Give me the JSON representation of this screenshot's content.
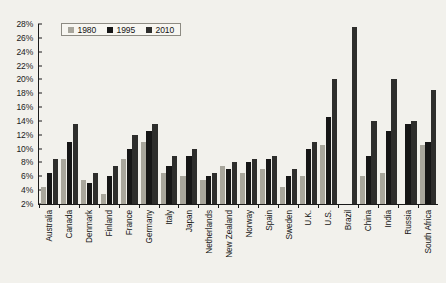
{
  "chart_data": {
    "type": "bar",
    "title": "",
    "xlabel": "",
    "ylabel": "",
    "ylim": [
      2,
      28
    ],
    "ytick_step": 2,
    "ytick_labels": [
      "28%",
      "26%",
      "24%",
      "22%",
      "20%",
      "18%",
      "16%",
      "14%",
      "12%",
      "10%",
      "8%",
      "6%",
      "4%",
      "2%"
    ],
    "grid": false,
    "legend_position": "top-left",
    "categories": [
      "Australia",
      "Canada",
      "Denmark",
      "Finland",
      "France",
      "Germany",
      "Italy",
      "Japan",
      "Netherlands",
      "New Zealand",
      "Norway",
      "Spain",
      "Sweden",
      "U.K.",
      "U.S.",
      "Brazil",
      "China",
      "India",
      "Russia",
      "South Africa"
    ],
    "series": [
      {
        "name": "1980",
        "color": "#a8a69c",
        "values": [
          4.5,
          8.5,
          5.5,
          3.5,
          8.5,
          11.0,
          6.5,
          6.0,
          5.5,
          7.5,
          6.5,
          7.0,
          4.5,
          6.0,
          10.5,
          null,
          6.0,
          6.5,
          null,
          10.5
        ]
      },
      {
        "name": "1995",
        "color": "#161616",
        "values": [
          6.5,
          11.0,
          5.0,
          6.0,
          10.0,
          12.5,
          7.5,
          9.0,
          6.0,
          7.0,
          8.0,
          8.5,
          6.0,
          10.0,
          14.5,
          null,
          9.0,
          12.5,
          13.5,
          11.0
        ]
      },
      {
        "name": "2010",
        "color": "#2e2e2c",
        "values": [
          8.5,
          13.5,
          6.5,
          7.5,
          12.0,
          13.5,
          9.0,
          10.0,
          6.5,
          8.0,
          8.5,
          9.0,
          7.0,
          11.0,
          20.0,
          27.5,
          14.0,
          20.0,
          14.0,
          18.5
        ]
      }
    ]
  },
  "legend": {
    "items": [
      {
        "label": "1980",
        "key": "s1980"
      },
      {
        "label": "1995",
        "key": "s1995"
      },
      {
        "label": "2010",
        "key": "s2010"
      }
    ]
  }
}
